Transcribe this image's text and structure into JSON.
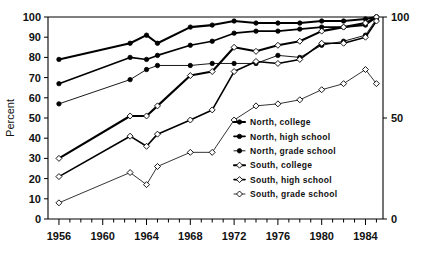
{
  "chart_data": {
    "type": "line",
    "title": "",
    "xlabel": "",
    "ylabel": "Percent",
    "xlim": [
      1955,
      1985.6
    ],
    "ylim": [
      0,
      100
    ],
    "y2lim": [
      0,
      100
    ],
    "grid": false,
    "legend_position": "inside-lower-right",
    "x_ticks_major": [
      1956,
      1960,
      1964,
      1968,
      1972,
      1976,
      1980,
      1984
    ],
    "x_tick_labels": [
      "1956",
      "1960",
      "1964",
      "1968",
      "1972",
      "1976",
      "1980",
      "1984"
    ],
    "x_ticks_minor_step": 1,
    "y_ticks": [
      0,
      10,
      20,
      30,
      40,
      50,
      60,
      70,
      80,
      90,
      100
    ],
    "y_tick_labels": [
      "0",
      "10",
      "20",
      "30",
      "40",
      "50",
      "60",
      "70",
      "80",
      "90",
      "100"
    ],
    "y2_ticks": [
      0,
      50,
      100
    ],
    "y2_tick_labels": [
      "0",
      "50",
      "100"
    ],
    "series": [
      {
        "name": "North, college",
        "marker": "filled-circle",
        "line_width": 2.1,
        "x": [
          1956,
          1962.5,
          1964,
          1965,
          1968,
          1970,
          1972,
          1974,
          1976,
          1978,
          1980,
          1982,
          1984,
          1985
        ],
        "values": [
          79,
          87,
          91,
          87,
          95,
          96,
          98,
          97,
          97,
          97,
          98,
          98,
          99,
          100
        ]
      },
      {
        "name": "North, high school",
        "marker": "filled-circle",
        "line_width": 1.6,
        "x": [
          1956,
          1962.5,
          1964,
          1965,
          1968,
          1970,
          1972,
          1974,
          1976,
          1978,
          1980,
          1982,
          1984,
          1985
        ],
        "values": [
          67,
          80,
          79,
          81,
          86,
          88,
          92,
          93,
          93,
          94,
          95,
          95,
          96,
          100
        ]
      },
      {
        "name": "North, grade school",
        "marker": "filled-circle",
        "line_width": 0.9,
        "x": [
          1956,
          1962.5,
          1964,
          1965,
          1968,
          1970,
          1972,
          1974,
          1976,
          1978,
          1980,
          1982,
          1984,
          1985
        ],
        "values": [
          57,
          69,
          74,
          76,
          76,
          77,
          77,
          77,
          81,
          80,
          86,
          88,
          91,
          99
        ]
      },
      {
        "name": "South, college",
        "marker": "open-diamond",
        "line_width": 2.1,
        "x": [
          1956,
          1962.5,
          1964,
          1965,
          1968,
          1970,
          1972,
          1974,
          1976,
          1978,
          1980,
          1982,
          1984,
          1985
        ],
        "values": [
          30,
          51,
          51,
          56,
          71,
          73,
          85,
          83,
          86,
          88,
          93,
          95,
          97,
          100
        ]
      },
      {
        "name": "South, high school",
        "marker": "open-diamond",
        "line_width": 1.6,
        "x": [
          1956,
          1962.5,
          1964,
          1965,
          1968,
          1970,
          1972,
          1974,
          1976,
          1978,
          1980,
          1982,
          1984,
          1985
        ],
        "values": [
          21,
          41,
          36,
          42,
          49,
          54,
          73,
          78,
          77,
          79,
          87,
          87,
          90,
          98
        ]
      },
      {
        "name": "South, grade school",
        "marker": "open-diamond",
        "line_width": 0.8,
        "x": [
          1956,
          1962.5,
          1964,
          1965,
          1968,
          1970,
          1972,
          1974,
          1976,
          1978,
          1980,
          1982,
          1984,
          1985
        ],
        "values": [
          8,
          23,
          17,
          26,
          33,
          33,
          49,
          56,
          57,
          59,
          64,
          67,
          74,
          67
        ]
      }
    ]
  },
  "legend": {
    "items": [
      {
        "label": "North, college"
      },
      {
        "label": "North, high school"
      },
      {
        "label": "North, grade school"
      },
      {
        "label": "South, college"
      },
      {
        "label": "South, high school"
      },
      {
        "label": "South, grade school"
      }
    ]
  }
}
